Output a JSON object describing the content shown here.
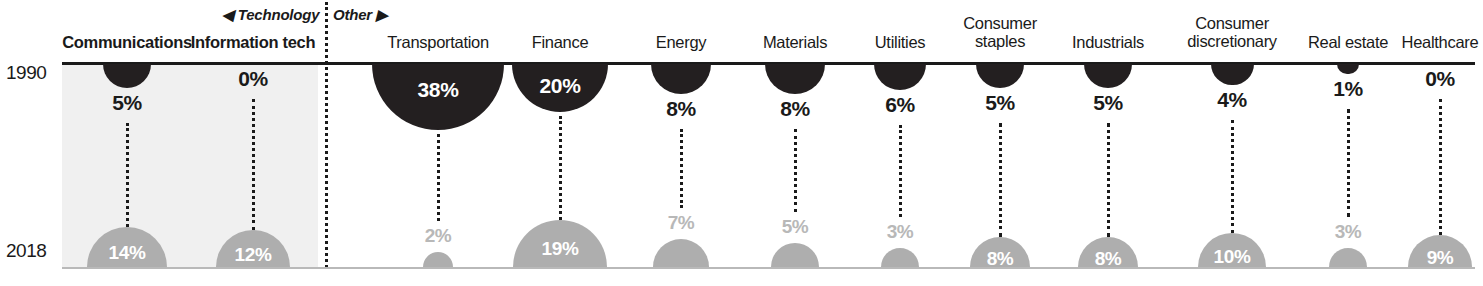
{
  "chart_data": {
    "type": "bar",
    "title": "",
    "subtitle": "",
    "xlabel": "",
    "ylabel": "",
    "legend_position": "none",
    "grid": false,
    "value_unit": "%",
    "row_labels": [
      "1990",
      "2018"
    ],
    "series": [
      {
        "name": "1990",
        "color": "#231f20",
        "values": [
          5,
          0,
          38,
          20,
          8,
          8,
          6,
          5,
          5,
          4,
          1,
          0
        ]
      },
      {
        "name": "2018",
        "color": "#aeaeae",
        "values": [
          14,
          12,
          2,
          19,
          7,
          5,
          3,
          8,
          8,
          10,
          3,
          9
        ]
      }
    ],
    "categories": [
      "Communications",
      "Information tech",
      "Transportation",
      "Finance",
      "Energy",
      "Materials",
      "Utilities",
      "Consumer staples",
      "Industrials",
      "Consumer discretionary",
      "Real estate",
      "Healthcare"
    ],
    "groups": [
      {
        "label": "Technology",
        "arrow": "left",
        "categories": [
          "Communications",
          "Information tech"
        ]
      },
      {
        "label": "Other",
        "arrow": "right",
        "categories": [
          "Transportation",
          "Finance",
          "Energy",
          "Materials",
          "Utilities",
          "Consumer staples",
          "Industrials",
          "Consumer discretionary",
          "Real estate",
          "Healthcare"
        ]
      }
    ]
  },
  "groups": {
    "technology": {
      "label": "Technology",
      "arrow": "◀"
    },
    "other": {
      "label": "Other",
      "arrow": "▶"
    }
  },
  "years": {
    "top": "1990",
    "bottom": "2018"
  },
  "columns": [
    {
      "name": "communications",
      "label": "Communications",
      "label_line2": "",
      "top_value": "5%",
      "bottom_value": "14%",
      "tech": true
    },
    {
      "name": "information-tech",
      "label": "Information tech",
      "label_line2": "",
      "top_value": "0%",
      "bottom_value": "12%",
      "tech": true
    },
    {
      "name": "transportation",
      "label": "Transportation",
      "label_line2": "",
      "top_value": "38%",
      "bottom_value": "2%",
      "tech": false
    },
    {
      "name": "finance",
      "label": "Finance",
      "label_line2": "",
      "top_value": "20%",
      "bottom_value": "19%",
      "tech": false
    },
    {
      "name": "energy",
      "label": "Energy",
      "label_line2": "",
      "top_value": "8%",
      "bottom_value": "7%",
      "tech": false
    },
    {
      "name": "materials",
      "label": "Materials",
      "label_line2": "",
      "top_value": "8%",
      "bottom_value": "5%",
      "tech": false
    },
    {
      "name": "utilities",
      "label": "Utilities",
      "label_line2": "",
      "top_value": "6%",
      "bottom_value": "3%",
      "tech": false
    },
    {
      "name": "consumer-staples",
      "label": "Consumer",
      "label_line2": "staples",
      "top_value": "5%",
      "bottom_value": "8%",
      "tech": false
    },
    {
      "name": "industrials",
      "label": "Industrials",
      "label_line2": "",
      "top_value": "5%",
      "bottom_value": "8%",
      "tech": false
    },
    {
      "name": "consumer-discretionary",
      "label": "Consumer",
      "label_line2": "discretionary",
      "top_value": "4%",
      "bottom_value": "10%",
      "tech": false
    },
    {
      "name": "real-estate",
      "label": "Real estate",
      "label_line2": "",
      "top_value": "1%",
      "bottom_value": "3%",
      "tech": false
    },
    {
      "name": "healthcare",
      "label": "Healthcare",
      "label_line2": "",
      "top_value": "0%",
      "bottom_value": "9%",
      "tech": false
    }
  ],
  "colors": {
    "top_fill": "#231f20",
    "bottom_fill": "#aeaeae",
    "band": "#f0f0f0",
    "axis_top": "#1a1a1a",
    "axis_bottom": "#b9b9b9",
    "muted_text": "#b8b8b8"
  }
}
